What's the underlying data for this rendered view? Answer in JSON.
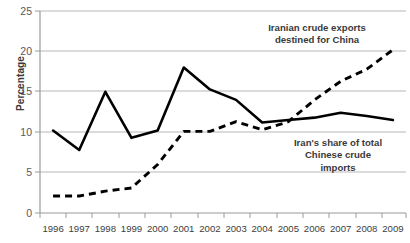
{
  "chart_data": {
    "type": "line",
    "title": "",
    "xlabel": "",
    "ylabel": "Percentage",
    "ylim": [
      0,
      25
    ],
    "yticks": [
      0,
      5,
      10,
      15,
      20,
      25
    ],
    "grid": true,
    "legend": "annotations-inline",
    "categories": [
      "1996",
      "1997",
      "1998",
      "1999",
      "2000",
      "2001",
      "2002",
      "2003",
      "2004",
      "2005",
      "2006",
      "2007",
      "2008",
      "2009"
    ],
    "series": [
      {
        "name": "Iran's share of total Chinese crude imports",
        "style": "solid",
        "color": "#000000",
        "values": [
          10.2,
          7.8,
          15.0,
          9.3,
          10.2,
          18.0,
          15.3,
          14.0,
          11.2,
          11.5,
          11.8,
          12.4,
          12.0,
          11.5
        ]
      },
      {
        "name": "Iranian crude exports destined for China",
        "style": "dashed",
        "color": "#000000",
        "values": [
          2.1,
          2.1,
          2.7,
          3.1,
          6.0,
          10.1,
          10.1,
          11.3,
          10.3,
          11.3,
          14.0,
          16.3,
          17.8,
          20.2
        ]
      }
    ],
    "annotations": [
      {
        "id": "exports",
        "lines": [
          "Iranian crude exports",
          "destined for China"
        ]
      },
      {
        "id": "share",
        "lines": [
          "Iran's share of total",
          "Chinese crude",
          "imports"
        ]
      }
    ]
  },
  "axis": {
    "y_title": "Percentage",
    "y_labels": [
      "25",
      "20",
      "15",
      "10",
      "5",
      "0"
    ],
    "x_labels": [
      "1996",
      "1997",
      "1998",
      "1999",
      "2000",
      "2001",
      "2002",
      "2003",
      "2004",
      "2005",
      "2006",
      "2007",
      "2008",
      "2009"
    ]
  },
  "annotations": {
    "exports_line1": "Iranian crude exports",
    "exports_line2": "destined for China",
    "share_line1": "Iran's share of total",
    "share_line2": "Chinese crude",
    "share_line3": "imports"
  },
  "colors": {
    "series_stroke": "#000000",
    "gridline": "#b7b7b7",
    "axis": "#9a9a9a",
    "text": "#3a3a3a"
  }
}
